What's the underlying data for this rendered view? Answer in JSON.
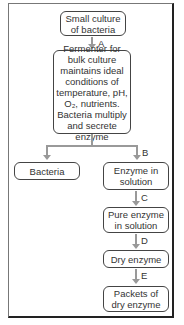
{
  "diagram": {
    "title": "",
    "nodes": {
      "start": "Small culture of bacteria",
      "fermenter": "Fermenter for bulk culture maintains ideal conditions of temperature, pH, O₂, nutrients. Bacteria multiply and secrete enzyme",
      "bacteria": "Bacteria",
      "enzyme_solution": "Enzyme in solution",
      "pure_enzyme": "Pure enzyme in solution",
      "dry_enzyme": "Dry enzyme",
      "packets": "Packets of dry enzyme"
    },
    "arrows": {
      "a": "A",
      "b": "B",
      "c": "C",
      "d": "D",
      "e": "E"
    },
    "colors": {
      "arrow": "#999999",
      "box_border": "#444444",
      "text": "#333333"
    }
  }
}
